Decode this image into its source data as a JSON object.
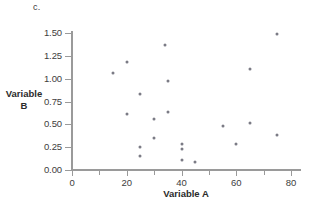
{
  "panel": {
    "label": "c."
  },
  "chart_data": {
    "type": "scatter",
    "title": "",
    "xlabel": "Variable A",
    "ylabel_line1": "Variable",
    "ylabel_line2": "B",
    "xlim": [
      0,
      84
    ],
    "ylim": [
      0.0,
      1.6
    ],
    "grid": false,
    "legend": null,
    "marker_color": "#7b7b85",
    "axis_color": "#9a9a9a",
    "x_ticks": [
      {
        "value": 0,
        "label": "0",
        "minor": false
      },
      {
        "value": 10,
        "label": "",
        "minor": true
      },
      {
        "value": 20,
        "label": "20",
        "minor": false
      },
      {
        "value": 30,
        "label": "",
        "minor": true
      },
      {
        "value": 40,
        "label": "40",
        "minor": false
      },
      {
        "value": 50,
        "label": "",
        "minor": true
      },
      {
        "value": 60,
        "label": "60",
        "minor": false
      },
      {
        "value": 70,
        "label": "",
        "minor": true
      },
      {
        "value": 80,
        "label": "80",
        "minor": false
      }
    ],
    "y_ticks": [
      {
        "value": 0.0,
        "label": "0.00"
      },
      {
        "value": 0.25,
        "label": "0.25"
      },
      {
        "value": 0.5,
        "label": "0.50"
      },
      {
        "value": 0.75,
        "label": "0.75"
      },
      {
        "value": 1.0,
        "label": "1.00"
      },
      {
        "value": 1.25,
        "label": "1.25"
      },
      {
        "value": 1.5,
        "label": "1.50"
      }
    ],
    "points": [
      {
        "x": 15,
        "y": 1.06
      },
      {
        "x": 20,
        "y": 1.18
      },
      {
        "x": 20,
        "y": 0.61
      },
      {
        "x": 25,
        "y": 0.83
      },
      {
        "x": 25,
        "y": 0.25
      },
      {
        "x": 25,
        "y": 0.15
      },
      {
        "x": 30,
        "y": 0.56
      },
      {
        "x": 30,
        "y": 0.35
      },
      {
        "x": 34,
        "y": 1.37
      },
      {
        "x": 35,
        "y": 0.97
      },
      {
        "x": 35,
        "y": 0.64
      },
      {
        "x": 40,
        "y": 0.28
      },
      {
        "x": 40,
        "y": 0.23
      },
      {
        "x": 40,
        "y": 0.11
      },
      {
        "x": 45,
        "y": 0.09
      },
      {
        "x": 55,
        "y": 0.48
      },
      {
        "x": 60,
        "y": 0.28
      },
      {
        "x": 65,
        "y": 1.11
      },
      {
        "x": 65,
        "y": 0.51
      },
      {
        "x": 75,
        "y": 1.49
      },
      {
        "x": 75,
        "y": 0.38
      }
    ]
  }
}
